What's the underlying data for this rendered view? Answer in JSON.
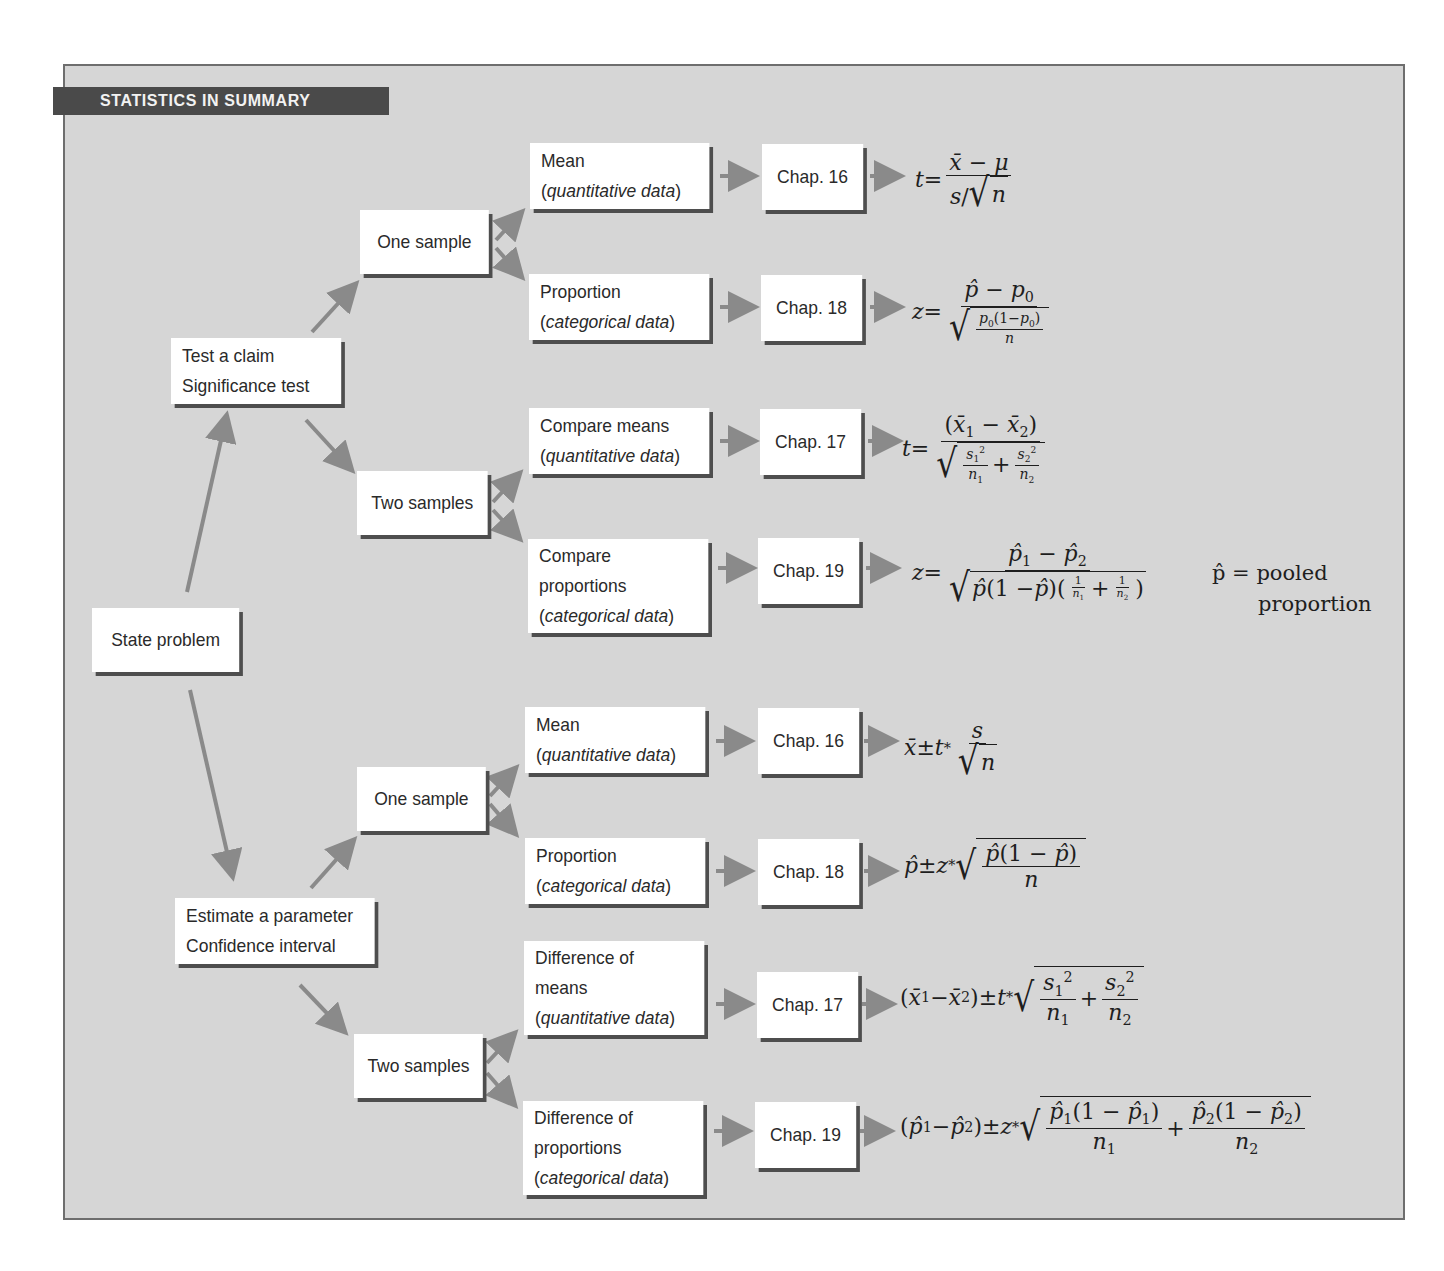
{
  "banner": {
    "title": "STATISTICS IN SUMMARY"
  },
  "colors": {
    "frame_bg": "#d6d6d6",
    "banner_bg": "#4a4a4a",
    "box_bg": "#ffffff",
    "box_shadow": "#4e4e4e",
    "arrow": "#8a8a8a"
  },
  "root": {
    "label": "State problem"
  },
  "branches": [
    {
      "id": "test",
      "line1": "Test a claim",
      "line2": "Significance test",
      "groups": [
        {
          "label": "One sample",
          "items": [
            {
              "line1": "Mean",
              "paren_open": "(",
              "italic": "quantitative data",
              "paren_close": ")",
              "chapter": "Chap. 16",
              "formula": "t = (x̄ − μ) / (s/√n)"
            },
            {
              "line1": "Proportion",
              "paren_open": "(",
              "italic": "categorical data",
              "paren_close": ")",
              "chapter": "Chap. 18",
              "formula": "z = (p̂ − p0) / √(p0(1−p0)/n)"
            }
          ]
        },
        {
          "label": "Two samples",
          "items": [
            {
              "line1": "Compare means",
              "paren_open": "(",
              "italic": "quantitative data",
              "paren_close": ")",
              "chapter": "Chap. 17",
              "formula": "t = (x̄1 − x̄2) / √(s1²/n1 + s2²/n2)"
            },
            {
              "line1": "Compare",
              "line2": "proportions",
              "paren_open": "(",
              "italic": "categorical data",
              "paren_close": ")",
              "chapter": "Chap. 19",
              "formula": "z = (p̂1 − p̂2) / √(p̂(1 − p̂)(1/n1 + 1/n2))",
              "note_line1": "p̂ = pooled",
              "note_line2": "proportion"
            }
          ]
        }
      ]
    },
    {
      "id": "estimate",
      "line1": "Estimate a parameter",
      "line2": "Confidence interval",
      "groups": [
        {
          "label": "One sample",
          "items": [
            {
              "line1": "Mean",
              "paren_open": "(",
              "italic": "quantitative data",
              "paren_close": ")",
              "chapter": "Chap. 16",
              "formula": "x̄ ± t* s/√n"
            },
            {
              "line1": "Proportion",
              "paren_open": "(",
              "italic": "categorical data",
              "paren_close": ")",
              "chapter": "Chap. 18",
              "formula": "p̂ ± z* √(p̂(1 − p̂)/n)"
            }
          ]
        },
        {
          "label": "Two samples",
          "items": [
            {
              "line1": "Difference of",
              "line2": "means",
              "paren_open": "(",
              "italic": "quantitative data",
              "paren_close": ")",
              "chapter": "Chap. 17",
              "formula": "(x̄1 − x̄2) ± t* √(s1²/n1 + s2²/n2)"
            },
            {
              "line1": "Difference of",
              "line2": "proportions",
              "paren_open": "(",
              "italic": "categorical data",
              "paren_close": ")",
              "chapter": "Chap. 19",
              "formula": "(p̂1 − p̂2) ± z* √(p̂1(1 − p̂1)/n1 + p̂2(1 − p̂2)/n2)"
            }
          ]
        }
      ]
    }
  ],
  "math": {
    "t": "t",
    "z": "z",
    "eq": " = ",
    "pm": " ± ",
    "plus": " + ",
    "minus": " − ",
    "xbar": "x̄",
    "mu": "μ",
    "s": "s",
    "n": "n",
    "phat": "p̂",
    "p": "p",
    "one": "1",
    "two": "2",
    "zero": "0",
    "sq": "2",
    "star": "*",
    "lp": "(",
    "rp": ")",
    "slash": "/",
    "root": "√",
    "one_minus": "1 − ",
    "one_minus_tight": "1−"
  }
}
